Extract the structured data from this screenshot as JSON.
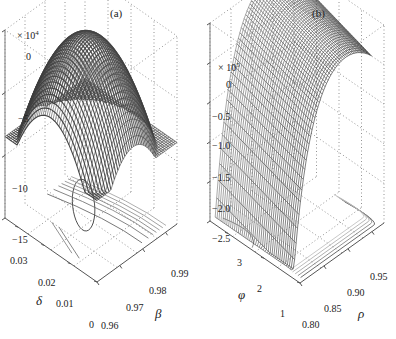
{
  "chart_data": [
    {
      "type": "surface3d",
      "panel_label": "(a)",
      "z_multiplier": "× 10^4",
      "z_multiplier_base": "× 10",
      "z_multiplier_exp": "4",
      "zlabel": "",
      "xlabel": "β",
      "ylabel": "δ",
      "zlim": [
        -15,
        0
      ],
      "z_ticks": [
        "0",
        "−5",
        "−10",
        "−15"
      ],
      "x_ticks": [
        "0.96",
        "0.97",
        "0.98",
        "0.99"
      ],
      "y_ticks": [
        "0",
        "0.01",
        "0.02",
        "0.03"
      ],
      "xlim": [
        0.96,
        0.995
      ],
      "ylim": [
        0,
        0.035
      ],
      "surface": {
        "shape": "concave dome (single peak)",
        "peak_z_approx": 1.2,
        "edge_z_min_approx": -8.5,
        "shading": "dark grey mesh"
      },
      "contours": "projected contour lines on base plane; closed elliptical contour near β≈0.975, δ≈0.015",
      "grid": true
    },
    {
      "type": "surface3d",
      "panel_label": "(b)",
      "z_multiplier": "× 10^5",
      "z_multiplier_base": "× 10",
      "z_multiplier_exp": "5",
      "zlabel": "",
      "xlabel": "ρ",
      "ylabel": "φ",
      "zlim": [
        -2.5,
        0
      ],
      "z_ticks": [
        "0",
        "−0.5",
        "−1.0",
        "−1.5",
        "−2.0",
        "−2.5"
      ],
      "x_ticks": [
        "0.80",
        "0.85",
        "0.90",
        "0.95"
      ],
      "y_ticks": [
        "1",
        "2",
        "3"
      ],
      "xlim": [
        0.78,
        0.98
      ],
      "ylim": [
        0.8,
        3.5
      ],
      "surface": {
        "shape": "ridge falling steeply toward low ρ",
        "peak_z_approx": 0.15,
        "min_z_approx": -2.45,
        "shading": "grey wireframe mesh"
      },
      "contours": "projected contour lines along low-φ / high-ρ corner of base plane",
      "grid": true
    }
  ]
}
